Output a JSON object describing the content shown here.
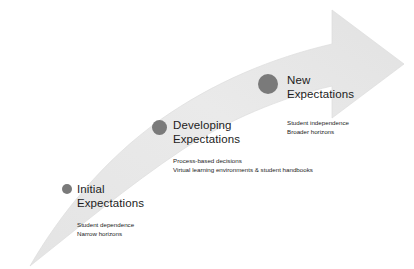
{
  "diagram": {
    "type": "curved-arrow-progression",
    "background_color": "#ffffff",
    "arrow": {
      "name": "progress-arrow",
      "fill_color": "#e8e8e8",
      "direction": "bottom-left to top-right",
      "description": "Upward sweeping curved arrow"
    },
    "marker_color": "#7a7a7a",
    "text_color": "#1c1c1c"
  },
  "stages": [
    {
      "id": "initial",
      "heading_line1": "Initial",
      "heading_line2": "Expectations",
      "detail_line1": "Student dependence",
      "detail_line2": "Narrow horizons",
      "marker_size": 10
    },
    {
      "id": "developing",
      "heading_line1": "Developing",
      "heading_line2": "Expectations",
      "detail_line1": "Process-based decisions",
      "detail_line2": "Virtual learning environments & student handbooks",
      "marker_size": 15
    },
    {
      "id": "new",
      "heading_line1": "New",
      "heading_line2": "Expectations",
      "detail_line1": "Student independence",
      "detail_line2": "Broader horizons",
      "marker_size": 20
    }
  ]
}
